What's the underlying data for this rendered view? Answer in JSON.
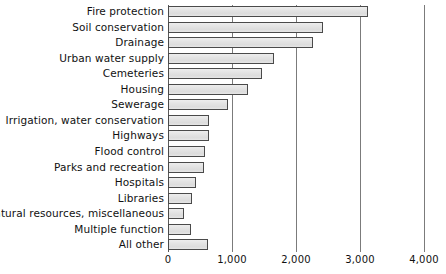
{
  "chart_data": {
    "type": "bar",
    "orientation": "horizontal",
    "title": "",
    "xlabel": "",
    "ylabel": "",
    "xlim": [
      0,
      4000
    ],
    "grid": true,
    "legend": null,
    "xticks": [
      0,
      1000,
      2000,
      3000,
      4000
    ],
    "xtick_labels": [
      "0",
      "1,000",
      "2,000",
      "3,000",
      "4,000"
    ],
    "categories": [
      "Fire protection",
      "Soil conservation",
      "Drainage",
      "Urban water supply",
      "Cemeteries",
      "Housing",
      "Sewerage",
      "Irrigation, water conservation",
      "Highways",
      "Flood control",
      "Parks and recreation",
      "Hospitals",
      "Libraries",
      "Natural resources, miscellaneous",
      "Multiple function",
      "All other"
    ],
    "values": [
      3130,
      2420,
      2270,
      1660,
      1470,
      1250,
      940,
      640,
      640,
      580,
      560,
      440,
      380,
      250,
      360,
      630
    ]
  },
  "style": {
    "bar_fill": "#e2e2e2",
    "bar_border": "#4a4a4a",
    "gridline_color": "#7b7b7b",
    "text_color": "#111111",
    "background": "#ffffff"
  }
}
